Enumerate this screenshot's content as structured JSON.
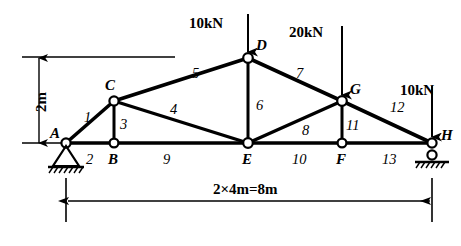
{
  "figure": {
    "type": "truss-diagram",
    "stroke_color": "#000000",
    "background_color": "#ffffff"
  },
  "nodes": [
    {
      "id": "A",
      "label": "A",
      "x": 66,
      "y": 143,
      "label_x": 50,
      "label_y": 126
    },
    {
      "id": "B",
      "label": "B",
      "x": 114,
      "y": 143,
      "label_x": 108,
      "label_y": 152
    },
    {
      "id": "C",
      "label": "C",
      "x": 114,
      "y": 101,
      "label_x": 105,
      "label_y": 78
    },
    {
      "id": "D",
      "label": "D",
      "x": 248,
      "y": 58,
      "label_x": 256,
      "label_y": 38
    },
    {
      "id": "E",
      "label": "E",
      "x": 248,
      "y": 143,
      "label_x": 242,
      "label_y": 152
    },
    {
      "id": "F",
      "label": "F",
      "x": 342,
      "y": 143,
      "label_x": 336,
      "label_y": 152
    },
    {
      "id": "G",
      "label": "G",
      "x": 342,
      "y": 101,
      "label_x": 350,
      "label_y": 82
    },
    {
      "id": "H",
      "label": "H",
      "x": 432,
      "y": 143,
      "label_x": 441,
      "label_y": 128
    }
  ],
  "members": [
    {
      "id": 1,
      "label": "1",
      "from": "A",
      "to": "C",
      "label_x": 84,
      "label_y": 110
    },
    {
      "id": 2,
      "label": "2",
      "from": "A",
      "to": "B",
      "label_x": 86,
      "label_y": 152
    },
    {
      "id": 3,
      "label": "3",
      "from": "C",
      "to": "B",
      "label_x": 120,
      "label_y": 117
    },
    {
      "id": 4,
      "label": "4",
      "from": "C",
      "to": "E",
      "label_x": 170,
      "label_y": 102
    },
    {
      "id": 5,
      "label": "5",
      "from": "C",
      "to": "D",
      "label_x": 192,
      "label_y": 66
    },
    {
      "id": 6,
      "label": "6",
      "from": "D",
      "to": "E",
      "label_x": 256,
      "label_y": 98
    },
    {
      "id": 7,
      "label": "7",
      "from": "D",
      "to": "G",
      "label_x": 296,
      "label_y": 66
    },
    {
      "id": 8,
      "label": "8",
      "from": "E",
      "to": "G",
      "label_x": 302,
      "label_y": 123
    },
    {
      "id": 9,
      "label": "9",
      "from": "B",
      "to": "E",
      "label_x": 163,
      "label_y": 152
    },
    {
      "id": 10,
      "label": "10",
      "from": "E",
      "to": "F",
      "label_x": 292,
      "label_y": 152
    },
    {
      "id": 11,
      "label": "11",
      "from": "G",
      "to": "F",
      "label_x": 346,
      "label_y": 118
    },
    {
      "id": 12,
      "label": "12",
      "from": "G",
      "to": "H",
      "label_x": 390,
      "label_y": 100
    },
    {
      "id": 13,
      "label": "13",
      "from": "F",
      "to": "H",
      "label_x": 382,
      "label_y": 152
    }
  ],
  "loads": [
    {
      "id": "load-D",
      "label": "10kN",
      "at_node": "D",
      "label_x": 189,
      "label_y": 16,
      "arrow_x": 248,
      "arrow_top": 14,
      "arrow_bottom": 52
    },
    {
      "id": "load-G",
      "label": "20kN",
      "at_node": "G",
      "label_x": 289,
      "label_y": 25,
      "arrow_x": 342,
      "arrow_top": 26,
      "arrow_bottom": 95
    },
    {
      "id": "load-H",
      "label": "10kN",
      "at_node": "H",
      "label_x": 400,
      "label_y": 83,
      "arrow_x": 432,
      "arrow_top": 86,
      "arrow_bottom": 137
    }
  ],
  "supports": [
    {
      "id": "support-A",
      "kind": "pin",
      "at_node": "A"
    },
    {
      "id": "support-H",
      "kind": "roller",
      "at_node": "H"
    }
  ],
  "dimensions": {
    "vertical": {
      "id": "dim-height",
      "label": "2m",
      "x": 39,
      "top": 58,
      "bottom": 143,
      "label_x": 34,
      "label_y": 112,
      "ref_line_top": {
        "x1": 22,
        "x2": 175,
        "y": 57
      },
      "ref_line_bottom": {
        "x1": 22,
        "x2": 62,
        "y": 143
      }
    },
    "horizontal": {
      "id": "dim-span",
      "label": "2×4m=8m",
      "y": 201,
      "left": 66,
      "right": 432,
      "label_x": 213,
      "label_y": 182,
      "ext_left": {
        "x": 66,
        "y1": 178,
        "y2": 222
      },
      "ext_right": {
        "x": 432,
        "y1": 178,
        "y2": 222
      }
    }
  }
}
